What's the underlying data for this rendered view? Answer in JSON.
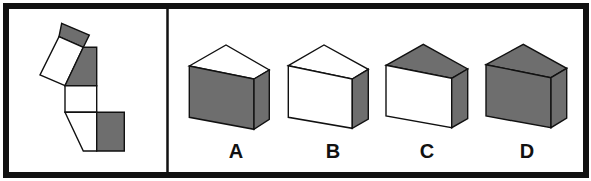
{
  "puzzle": {
    "type": "cube-net-folding",
    "colors": {
      "border": "#111111",
      "shaded_face": "#6e6e6e",
      "blank_face": "#ffffff",
      "stroke": "#111111"
    },
    "net": {
      "faces": [
        {
          "id": "small-tilted-rect",
          "fill": "shaded"
        },
        {
          "id": "tilted-rect",
          "fill": "blank"
        },
        {
          "id": "pentagon",
          "fill": "shaded"
        },
        {
          "id": "middle-square",
          "fill": "blank"
        },
        {
          "id": "trapezoid",
          "fill": "blank"
        },
        {
          "id": "side-square",
          "fill": "shaded"
        }
      ]
    },
    "options": [
      {
        "label": "A",
        "top": "blank",
        "front": "shaded",
        "side": "shaded"
      },
      {
        "label": "B",
        "top": "blank",
        "front": "blank",
        "side": "shaded"
      },
      {
        "label": "C",
        "top": "shaded",
        "front": "blank",
        "side": "shaded"
      },
      {
        "label": "D",
        "top": "shaded",
        "front": "shaded",
        "side": "shaded"
      }
    ]
  }
}
